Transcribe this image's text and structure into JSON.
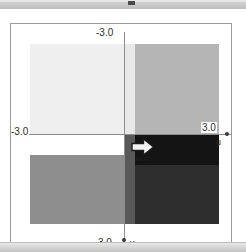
{
  "window": {
    "title_bar_mark": "window-marker"
  },
  "plot": {
    "axis_u_name": "u",
    "axis_v_name": "v",
    "label_u_min": "-3.0",
    "label_u_max": "3.0",
    "label_v_min": "-3.0",
    "label_v_max": "3.0"
  },
  "next_button": {
    "label": "NEXT",
    "icon": "arrow-right-icon"
  },
  "colors": {
    "panel_background": "#ffffff",
    "panel_border": "#9b9b9b",
    "axis": "#8d8d8d",
    "title_bar": "#c9c9c9",
    "status_strip": "#d6d6d6",
    "text": "#2b2b2b"
  },
  "chart_data": {
    "type": "heatmap",
    "title": "",
    "xlabel": "u",
    "ylabel": "v",
    "xlim": [
      -3.0,
      3.0
    ],
    "ylim": [
      -3.0,
      3.0
    ],
    "grid": false,
    "legend": "none",
    "colormap": "grayscale",
    "xtick_labels": [
      "-3.0",
      "3.0"
    ],
    "ytick_labels": [
      "-3.0",
      "3.0"
    ],
    "cells": [
      {
        "name": "upper-left-block",
        "u0": -2.6,
        "u1": 0.0,
        "v0": -2.6,
        "v1": 0.0,
        "gray": 0.94,
        "color": "#efefef"
      },
      {
        "name": "upper-mid-strip",
        "u0": 0.0,
        "u1": 0.3,
        "v0": -2.6,
        "v1": 0.0,
        "gray": 0.91,
        "color": "#e8e8e8"
      },
      {
        "name": "upper-right-block",
        "u0": 0.3,
        "u1": 2.6,
        "v0": -2.6,
        "v1": 0.0,
        "gray": 0.71,
        "color": "#b5b5b5"
      },
      {
        "name": "lower-left-white-gap",
        "u0": -2.6,
        "u1": 0.0,
        "v0": 0.0,
        "v1": 0.6,
        "gray": 1.0,
        "color": "#ffffff"
      },
      {
        "name": "lower-left-block",
        "u0": -2.6,
        "u1": 0.0,
        "v0": 0.6,
        "v1": 2.6,
        "gray": 0.56,
        "color": "#8e8e8e"
      },
      {
        "name": "lower-mid-strip",
        "u0": 0.0,
        "u1": 0.3,
        "v0": 0.0,
        "v1": 2.6,
        "gray": 0.35,
        "color": "#595959"
      },
      {
        "name": "lower-right-upper-block",
        "u0": 0.3,
        "u1": 2.6,
        "v0": 0.0,
        "v1": 0.9,
        "gray": 0.08,
        "color": "#141414"
      },
      {
        "name": "lower-right-lower-block",
        "u0": 0.3,
        "u1": 2.6,
        "v0": 0.9,
        "v1": 2.6,
        "gray": 0.18,
        "color": "#2e2e2e"
      }
    ]
  }
}
